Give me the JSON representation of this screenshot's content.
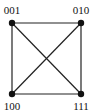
{
  "diagram": {
    "type": "graph",
    "nodes": [
      {
        "id": "n001",
        "label": "001",
        "x": 12,
        "y": 23,
        "lx": 12,
        "ly": 13
      },
      {
        "id": "n010",
        "label": "010",
        "x": 81,
        "y": 23,
        "lx": 81,
        "ly": 13
      },
      {
        "id": "n100",
        "label": "100",
        "x": 12,
        "y": 94,
        "lx": 12,
        "ly": 110
      },
      {
        "id": "n111",
        "label": "111",
        "x": 81,
        "y": 94,
        "lx": 81,
        "ly": 110
      }
    ],
    "edges": [
      [
        "n001",
        "n010"
      ],
      [
        "n001",
        "n100"
      ],
      [
        "n010",
        "n111"
      ],
      [
        "n100",
        "n111"
      ],
      [
        "n001",
        "n111"
      ],
      [
        "n010",
        "n100"
      ]
    ],
    "colors": {
      "node": "#111111",
      "edge": "#222222",
      "label": "#111111"
    }
  }
}
